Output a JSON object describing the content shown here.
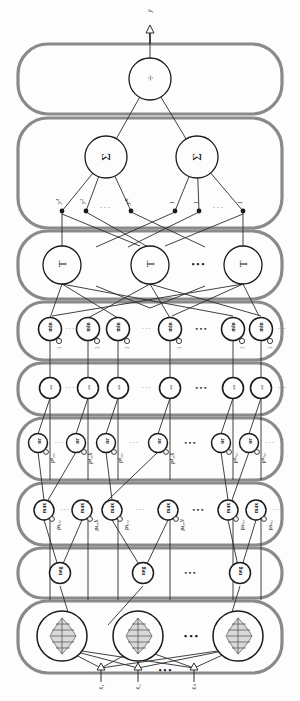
{
  "diagram": {
    "orientation": "rotated-90-ccw",
    "output": {
      "label": "ŷ",
      "arrow": "up-arrow-outline"
    },
    "layers": [
      {
        "id": "layer-8-defuzzify",
        "name": "division-layer",
        "node_symbol": "÷",
        "nodes": [
          "÷"
        ],
        "ellipsis": false
      },
      {
        "id": "layer-7-summation",
        "name": "summation-layer",
        "node_symbol": "Σ",
        "nodes": [
          "Σ",
          "Σ"
        ],
        "edge_labels_left": [
          "y¹",
          "y²",
          "yᴹ"
        ],
        "edge_labels_right": [
          "1",
          "1",
          "1"
        ],
        "ellipsis": true
      },
      {
        "id": "layer-6-tnorm",
        "name": "t-norm-layer",
        "node_symbol": "T",
        "nodes": [
          "T",
          "T",
          "T"
        ],
        "ellipsis": true
      },
      {
        "id": "layer-5-min",
        "name": "min-layer",
        "node_symbol": "min",
        "nodes": [
          "min",
          "min",
          "min",
          "min",
          "min",
          "min"
        ],
        "port_label": "1",
        "ellipsis": true
      },
      {
        "id": "layer-4-implication",
        "name": "implication-layer",
        "node_symbol": "⇔",
        "nodes": [
          "⇔",
          "⇔",
          "⇔",
          "⇔",
          "⇔",
          "⇔"
        ],
        "ellipsis": true
      },
      {
        "id": "layer-3-or",
        "name": "or-layer",
        "node_symbol": "or",
        "nodes": [
          "or",
          "or",
          "or",
          "or",
          "or",
          "or"
        ],
        "edge_labels": [
          "pᴬ₁,₁",
          "pᴬ₁,K",
          "pᴬ₁,₁",
          "pᴬ₁,K",
          "pᴬₙ,₁",
          "pᴬₙ,₂"
        ],
        "ellipsis": true
      },
      {
        "id": "layer-2-max",
        "name": "max-layer",
        "node_symbol": "max",
        "nodes": [
          "max",
          "max",
          "max",
          "max",
          "max",
          "max"
        ],
        "edge_labels": [
          "pᴀ₁,₁",
          "pᴀ₁,K",
          "pᴀ₁,₁",
          "pᴀ₁,N",
          "pᴀₙ,₁",
          "pᴀₙ,₂"
        ],
        "ellipsis": true
      },
      {
        "id": "layer-1b-neg",
        "name": "negation-layer",
        "node_symbol": "neg",
        "nodes": [
          "neg",
          "neg",
          "neg"
        ],
        "ellipsis": true
      },
      {
        "id": "layer-1a-membership",
        "name": "membership-function-layer",
        "node_symbol": "mf",
        "nodes": [
          "mf",
          "mf",
          "mf"
        ],
        "ellipsis": true
      }
    ],
    "inputs": {
      "labels": [
        "x̄₁",
        "x̄₂",
        "x̄ₙ"
      ],
      "ellipsis": "• • •",
      "arrow": "up-arrow-outline"
    },
    "ellipsis_glyph": "• • •",
    "dots_glyph": "· · ·",
    "colors": {
      "container_border": "#8a8a8a",
      "node_stroke": "#1a1a1a",
      "edge_stroke": "#2b2b2b",
      "background": "#fdfdfd",
      "text": "#111111"
    }
  }
}
